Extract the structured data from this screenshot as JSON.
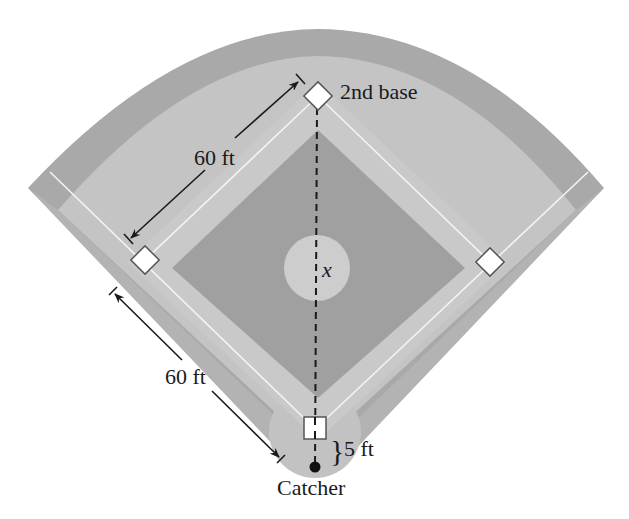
{
  "diagram": {
    "labels": {
      "second_base": "2nd base",
      "upper_distance": "60 ft",
      "lower_distance": "60 ft",
      "pitcher_distance_var": "x",
      "catcher_offset": "5 ft",
      "catcher": "Catcher"
    },
    "brace": "}",
    "colors": {
      "background": "#ffffff",
      "warning_track": "#a9a9a9",
      "outfield_grass": "#c4c4c4",
      "infield_grass_dark": "#a0a0a0",
      "baseline_path": "#c9c9c9",
      "pitcher_mound": "#cdcdcd",
      "home_circle": "#c2c2c2",
      "chalk_line": "#f4f4f4",
      "base": "#ffffff",
      "ink": "#1a1a1a"
    }
  }
}
